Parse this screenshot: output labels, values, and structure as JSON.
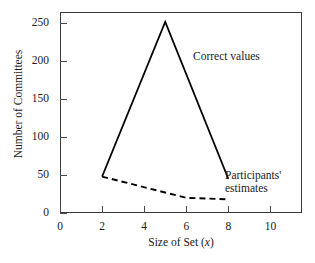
{
  "chart_data": {
    "type": "line",
    "title": "",
    "xlabel": "Size of Set (x)",
    "xlabel_plain": "Size of Set ",
    "xlabel_italic": "x",
    "ylabel": "Number of Committees",
    "xlim": [
      0,
      11.5
    ],
    "ylim": [
      0,
      265
    ],
    "xticks": [
      0,
      2,
      4,
      6,
      8,
      10
    ],
    "xtick_labels": [
      "0",
      "2",
      "4",
      "6",
      "8",
      "10"
    ],
    "yticks": [
      0,
      50,
      100,
      150,
      200,
      250
    ],
    "ytick_labels": [
      "0",
      "50",
      "100",
      "150",
      "200",
      "250"
    ],
    "grid": false,
    "legend_position": "inline-annotations",
    "series": [
      {
        "name": "Correct values",
        "style": "solid",
        "color": "#000000",
        "x": [
          2,
          5,
          8
        ],
        "values": [
          48,
          252,
          45
        ]
      },
      {
        "name": "Participants' estimates",
        "style": "dashed",
        "color": "#000000",
        "x": [
          2,
          6,
          8
        ],
        "values": [
          48,
          20,
          18
        ]
      }
    ],
    "annotations": [
      {
        "text": "Correct values",
        "x": 5.0,
        "y": 215
      },
      {
        "text_line1": "Participants'",
        "text_line2": "estimates",
        "x": 8.4,
        "y": 48
      }
    ]
  },
  "axis": {
    "y_title": "Number of Committees",
    "x_title_plain": "Size of Set (",
    "x_title_italic": "x",
    "x_title_tail": ")"
  },
  "annotations": {
    "correct_values": "Correct values",
    "estimates_line1": "Participants'",
    "estimates_line2": "estimates"
  }
}
